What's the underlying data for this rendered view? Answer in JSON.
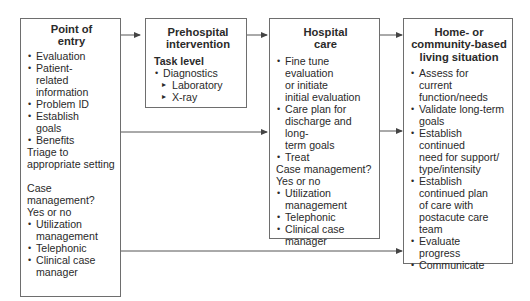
{
  "boxes": {
    "point_of_entry": {
      "title_lines": [
        "Point of",
        "entry"
      ],
      "items": [
        {
          "type": "bullet",
          "text": "Evaluation"
        },
        {
          "type": "bullet",
          "text": "Patient-"
        },
        {
          "type": "cont",
          "text": "related"
        },
        {
          "type": "cont",
          "text": "information"
        },
        {
          "type": "bullet",
          "text": "Problem ID"
        },
        {
          "type": "bullet",
          "text": "Establish"
        },
        {
          "type": "cont",
          "text": "goals"
        },
        {
          "type": "bullet",
          "text": "Benefits"
        },
        {
          "type": "plain",
          "text": "Triage to"
        },
        {
          "type": "plain",
          "text": "appropriate setting"
        },
        {
          "type": "gap",
          "text": ""
        },
        {
          "type": "plain",
          "text": "Case"
        },
        {
          "type": "plain",
          "text": "management?"
        },
        {
          "type": "plain",
          "text": "Yes or no"
        },
        {
          "type": "bullet",
          "text": "Utilization"
        },
        {
          "type": "cont",
          "text": "management"
        },
        {
          "type": "bullet",
          "text": "Telephonic"
        },
        {
          "type": "bullet",
          "text": "Clinical case"
        },
        {
          "type": "cont",
          "text": "manager"
        }
      ]
    },
    "prehospital": {
      "title_lines": [
        "Prehospital",
        "intervention"
      ],
      "items": [
        {
          "type": "heading",
          "text": "Task level"
        },
        {
          "type": "bullet",
          "text": "Diagnostics"
        },
        {
          "type": "sub",
          "text": "Laboratory"
        },
        {
          "type": "sub",
          "text": "X-ray"
        }
      ]
    },
    "hospital_care": {
      "title_lines": [
        "Hospital",
        "care"
      ],
      "items": [
        {
          "type": "bullet",
          "text": "Fine tune"
        },
        {
          "type": "cont",
          "text": "evaluation"
        },
        {
          "type": "cont",
          "text": "or initiate"
        },
        {
          "type": "cont",
          "text": "initial evaluation"
        },
        {
          "type": "bullet",
          "text": "Care plan for"
        },
        {
          "type": "cont",
          "text": "discharge and long-"
        },
        {
          "type": "cont",
          "text": "term goals"
        },
        {
          "type": "bullet",
          "text": "Treat"
        },
        {
          "type": "plain",
          "text": "Case management?"
        },
        {
          "type": "plain",
          "text": "Yes or no"
        },
        {
          "type": "bullet",
          "text": "Utilization"
        },
        {
          "type": "cont",
          "text": "management"
        },
        {
          "type": "bullet",
          "text": "Telephonic"
        },
        {
          "type": "bullet",
          "text": "Clinical case"
        },
        {
          "type": "cont",
          "text": "manager"
        }
      ]
    },
    "home_community": {
      "title_lines": [
        "Home- or",
        "community-based",
        "living situation"
      ],
      "items": [
        {
          "type": "bullet",
          "text": "Assess for"
        },
        {
          "type": "cont",
          "text": "current"
        },
        {
          "type": "cont",
          "text": "function/needs"
        },
        {
          "type": "bullet",
          "text": "Validate long-term"
        },
        {
          "type": "cont",
          "text": "goals"
        },
        {
          "type": "bullet",
          "text": "Establish continued"
        },
        {
          "type": "cont",
          "text": "need for support/"
        },
        {
          "type": "cont",
          "text": "type/intensity"
        },
        {
          "type": "bullet",
          "text": "Establish"
        },
        {
          "type": "cont",
          "text": "continued plan"
        },
        {
          "type": "cont",
          "text": "of care with"
        },
        {
          "type": "cont",
          "text": "postacute care"
        },
        {
          "type": "cont",
          "text": "team"
        },
        {
          "type": "bullet",
          "text": "Evaluate"
        },
        {
          "type": "cont",
          "text": "progress"
        },
        {
          "type": "bullet",
          "text": "Communicate"
        }
      ]
    }
  },
  "colors": {
    "line": "#555555",
    "border": "#6e6e6e",
    "text": "#2a2a2a"
  }
}
